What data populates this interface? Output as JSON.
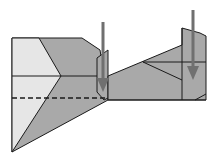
{
  "diagram": {
    "type": "origami-fold-step",
    "colors": {
      "background": "#ffffff",
      "paper_front": "#a9a9a9",
      "paper_back": "#e6e6e6",
      "line": "#1a1a1a",
      "arrow": "#707070"
    },
    "arrows": [
      {
        "name": "push-down-arrow-left",
        "x": 103,
        "y1": 22,
        "y2": 92
      },
      {
        "name": "push-down-arrow-right",
        "x": 193,
        "y1": 10,
        "y2": 80
      }
    ],
    "fold_lines": [
      {
        "name": "valley-fold-dashed",
        "style": "dashed",
        "y": 98
      }
    ]
  }
}
